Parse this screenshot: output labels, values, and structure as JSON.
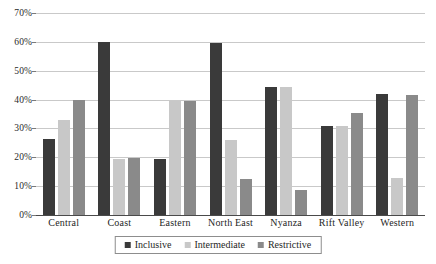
{
  "chart_data": {
    "type": "bar",
    "title": "",
    "subtitle": "",
    "xlabel": "",
    "ylabel": "",
    "ylim": [
      0,
      70
    ],
    "ytick_labels": [
      "0%",
      "10%",
      "20%",
      "30%",
      "40%",
      "50%",
      "60%",
      "70%"
    ],
    "ytick_values": [
      0,
      10,
      20,
      30,
      40,
      50,
      60,
      70
    ],
    "grid": "horizontal",
    "legend_position": "bottom",
    "categories": [
      "Central",
      "Coast",
      "Eastern",
      "North East",
      "Nyanza",
      "Rift Valley",
      "Western"
    ],
    "series": [
      {
        "name": "Inclusive",
        "color": "#3a3a3a",
        "values": [
          26.5,
          60.0,
          19.5,
          59.5,
          44.5,
          31.0,
          41.8
        ]
      },
      {
        "name": "Intermediate",
        "color": "#c8c8c8",
        "values": [
          33.0,
          19.5,
          39.5,
          26.0,
          44.5,
          30.8,
          13.0
        ]
      },
      {
        "name": "Restrictive",
        "color": "#8a8a8a",
        "values": [
          40.0,
          19.7,
          39.5,
          12.5,
          8.5,
          35.3,
          41.7
        ]
      }
    ]
  }
}
